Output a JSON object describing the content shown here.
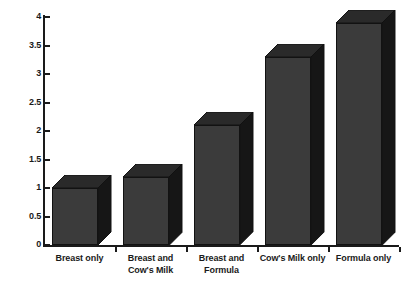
{
  "chart_data": {
    "type": "bar",
    "title": "",
    "subtitle": "",
    "xlabel": "",
    "ylabel": "",
    "categories": [
      "Breast only",
      "Breast and Cow's Milk",
      "Breast and Formula",
      "Cow's Milk only",
      "Formula only"
    ],
    "category_lines": [
      [
        "Breast only"
      ],
      [
        "Breast and",
        "Cow's Milk"
      ],
      [
        "Breast and",
        "Formula"
      ],
      [
        "Cow's Milk only"
      ],
      [
        "Formula only"
      ]
    ],
    "values": [
      1.0,
      1.2,
      2.1,
      3.3,
      3.9
    ],
    "ylim": [
      0,
      4
    ],
    "ytick_values": [
      0,
      0.5,
      1,
      1.5,
      2,
      2.5,
      3,
      3.5,
      4
    ],
    "ytick_labels": [
      "0",
      "0.5",
      "1",
      "1.5",
      "2",
      "2.5",
      "3",
      "3.5",
      "4"
    ],
    "grid": false,
    "legend": null,
    "legend_position": "none",
    "style": "3d-bar",
    "colors": {
      "bar_front": "#3b3b3b",
      "bar_side": "#161616",
      "bar_top": "#2a2a2a",
      "bar_outline": "#121212",
      "axis": "#1a1a1a",
      "background": "#ffffff",
      "text": "#1a1a1a"
    }
  }
}
